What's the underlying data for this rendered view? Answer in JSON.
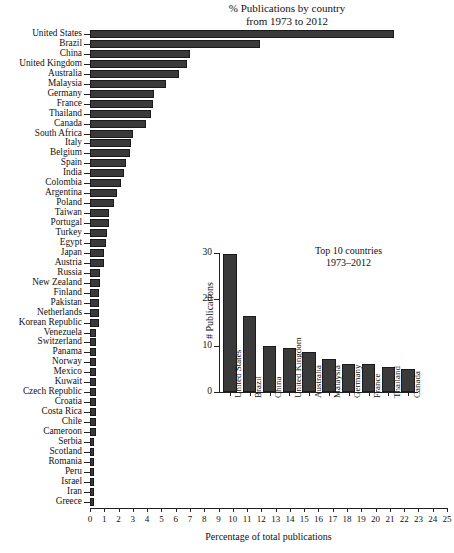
{
  "chart_data": [
    {
      "type": "bar",
      "orientation": "horizontal",
      "title": "% Publications by country\nfrom 1973 to 2012",
      "title_lines": [
        "% Publications by country",
        "from 1973 to 2012"
      ],
      "xlabel": "Percentage of total publications",
      "ylabel": "",
      "xlim": [
        0,
        25
      ],
      "xticks": [
        0,
        1,
        2,
        3,
        4,
        5,
        6,
        7,
        8,
        9,
        10,
        11,
        12,
        13,
        14,
        15,
        16,
        17,
        18,
        19,
        20,
        21,
        22,
        23,
        24,
        25
      ],
      "grid": false,
      "legend": "none",
      "categories": [
        "United States",
        "Brazil",
        "China",
        "United Kingdom",
        "Australia",
        "Malaysia",
        "Germany",
        "France",
        "Thailand",
        "Canada",
        "South Africa",
        "Italy",
        "Belgium",
        "Spain",
        "India",
        "Colombia",
        "Argentina",
        "Poland",
        "Taiwan",
        "Portugal",
        "Turkey",
        "Egypt",
        "Japan",
        "Austria",
        "Russia",
        "New Zealand",
        "Finland",
        "Pakistan",
        "Netherlands",
        "Korean Republic",
        "Venezuela",
        "Switzerland",
        "Panama",
        "Norway",
        "Mexico",
        "Kuwait",
        "Czech Republic",
        "Croatia",
        "Costa Rica",
        "Chile",
        "Cameroon",
        "Serbia",
        "Scotland",
        "Romania",
        "Peru",
        "Israel",
        "Iran",
        "Greece"
      ],
      "values": [
        21.3,
        11.9,
        7.0,
        6.8,
        6.2,
        5.3,
        4.5,
        4.4,
        4.3,
        3.9,
        3.0,
        2.9,
        2.8,
        2.5,
        2.4,
        2.2,
        1.9,
        1.7,
        1.3,
        1.3,
        1.2,
        1.1,
        1.0,
        1.0,
        0.7,
        0.7,
        0.6,
        0.6,
        0.6,
        0.6,
        0.45,
        0.45,
        0.45,
        0.45,
        0.45,
        0.45,
        0.4,
        0.4,
        0.4,
        0.4,
        0.4,
        0.25,
        0.25,
        0.25,
        0.25,
        0.25,
        0.25,
        0.25
      ]
    },
    {
      "type": "bar",
      "orientation": "vertical",
      "title": "Top 10 countries\n1973–2012",
      "title_lines": [
        "Top 10 countries",
        "1973–2012"
      ],
      "xlabel": "",
      "ylabel": "# Publications",
      "ylim": [
        0,
        30
      ],
      "yticks": [
        0,
        10,
        20,
        30
      ],
      "grid": false,
      "legend": "none",
      "categories": [
        "United States",
        "Brazil",
        "China",
        "United Kingdom",
        "Australia",
        "Malaysia",
        "Germany",
        "France",
        "Thailand",
        "Canada"
      ],
      "values": [
        29.8,
        16.5,
        9.9,
        9.5,
        8.7,
        7.2,
        6.1,
        6.1,
        5.5,
        5.0
      ]
    }
  ],
  "colors": {
    "bar_fill": "#3a3a3a",
    "bar_edge": "#1a1a1a",
    "axis": "#222222",
    "background": "#ffffff",
    "text": "#111111"
  }
}
